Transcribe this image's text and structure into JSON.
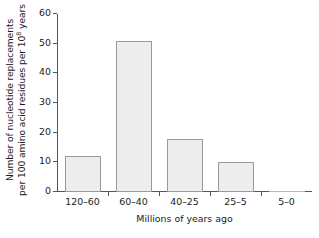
{
  "chart_data": {
    "type": "bar",
    "title": "",
    "subtitle": "",
    "categories": [
      "120–60",
      "60–40",
      "40–25",
      "25–5",
      "5–0"
    ],
    "values": [
      12,
      51,
      18,
      10,
      0
    ],
    "xlabel": "Millions of years ago",
    "ylabel_line1": "Number of nucleotide replacements",
    "ylabel_line2_pre": "per 100 amino acid residues per 10",
    "ylabel_exponent": "8",
    "ylabel_line2_post": " years",
    "ylim": [
      0,
      60
    ],
    "yticks": [
      0,
      10,
      20,
      30,
      40,
      50,
      60
    ],
    "ytick_labels": [
      "0",
      "10",
      "20",
      "30",
      "40",
      "50",
      "60"
    ],
    "grid": false,
    "legend": "none",
    "bar_fill_color": "#ededed",
    "bar_edge_color": "#9a9a9a",
    "axis_color": "#555555",
    "background_color": "#ffffff"
  }
}
